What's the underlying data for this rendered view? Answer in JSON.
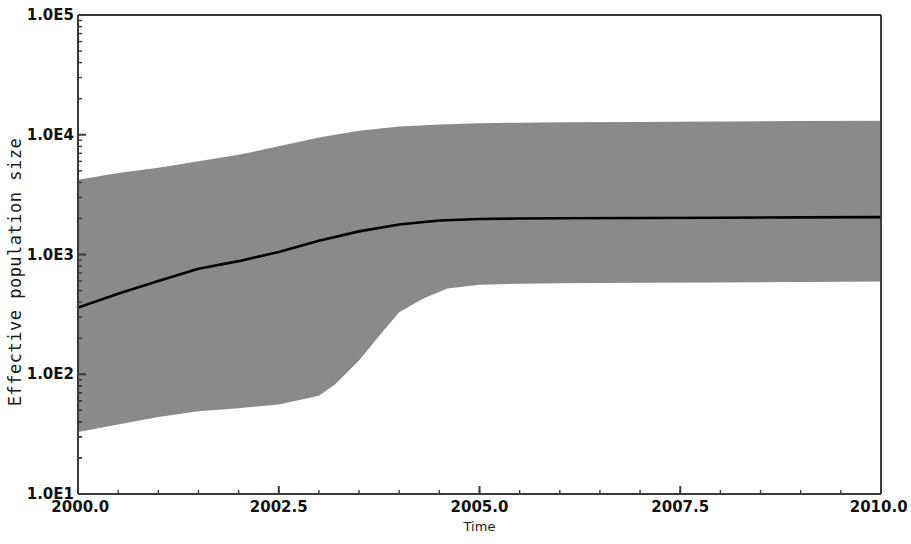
{
  "chart_data": {
    "type": "area",
    "title": "",
    "xlabel": "Time",
    "ylabel": "Effective population size",
    "xlim": [
      2000.0,
      2010.0
    ],
    "ylim": [
      10,
      100000
    ],
    "yscale": "log",
    "xscale": "linear",
    "grid": false,
    "legend": null,
    "x_ticks": [
      "2000.0",
      "2002.5",
      "2005.0",
      "2007.5",
      "2010.0"
    ],
    "x_tick_values": [
      2000.0,
      2002.5,
      2005.0,
      2007.5,
      2010.0
    ],
    "y_ticks": [
      "1.0E5",
      "1.0E4",
      "1.0E3",
      "1.0E2",
      "1.0E1"
    ],
    "y_tick_values": [
      100000,
      10000,
      1000,
      100,
      10
    ],
    "band_color": "#8a8a8a",
    "line_color": "#000000",
    "axis_color": "#3a3a3a",
    "background_color": "#ffffff",
    "series": [
      {
        "name": "median",
        "x": [
          2000.0,
          2000.5,
          2001.0,
          2001.5,
          2002.0,
          2002.5,
          2003.0,
          2003.5,
          2004.0,
          2004.5,
          2005.0,
          2005.5,
          2006.0,
          2007.0,
          2008.0,
          2009.0,
          2010.0
        ],
        "values": [
          360,
          470,
          600,
          760,
          880,
          1050,
          1300,
          1560,
          1780,
          1920,
          1980,
          2000,
          2010,
          2020,
          2030,
          2040,
          2050
        ]
      },
      {
        "name": "upper_95_HPD",
        "x": [
          2000.0,
          2000.5,
          2001.0,
          2001.5,
          2002.0,
          2002.5,
          2003.0,
          2003.5,
          2004.0,
          2004.5,
          2005.0,
          2005.5,
          2006.0,
          2007.0,
          2008.0,
          2009.0,
          2010.0
        ],
        "values": [
          4200,
          4800,
          5300,
          6000,
          6800,
          8000,
          9500,
          10800,
          11700,
          12200,
          12500,
          12600,
          12700,
          12800,
          12900,
          13000,
          13100
        ]
      },
      {
        "name": "lower_95_HPD",
        "x": [
          2000.0,
          2000.5,
          2001.0,
          2001.5,
          2002.0,
          2002.5,
          2003.0,
          2003.2,
          2003.5,
          2003.8,
          2004.0,
          2004.3,
          2004.6,
          2005.0,
          2005.5,
          2006.0,
          2007.0,
          2008.0,
          2009.0,
          2010.0
        ],
        "values": [
          33,
          38,
          44,
          49,
          52,
          56,
          66,
          82,
          130,
          230,
          330,
          430,
          520,
          560,
          570,
          575,
          580,
          585,
          590,
          595
        ]
      }
    ]
  },
  "axes": {
    "y_title": "Effective population size",
    "x_title": "Time"
  }
}
